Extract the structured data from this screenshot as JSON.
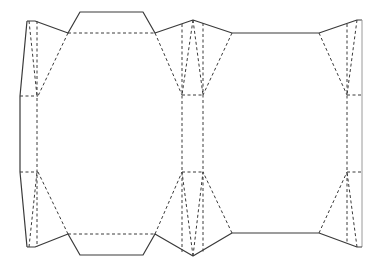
{
  "diagram": {
    "type": "packaging-dieline",
    "colors": {
      "background": "#ffffff",
      "cut_line": "#3a3a3a",
      "light_cut_line": "#9a9a9a",
      "fold_line": "#3a3a3a"
    },
    "legend": {
      "cut": "solid line",
      "fold": "dashed line"
    },
    "panels": [
      {
        "name": "left-glue-flap"
      },
      {
        "name": "front-panel",
        "has_top_tab": true,
        "has_bottom_tab": true
      },
      {
        "name": "middle-side-gusset"
      },
      {
        "name": "back-panel"
      },
      {
        "name": "right-side-gusset"
      }
    ]
  }
}
